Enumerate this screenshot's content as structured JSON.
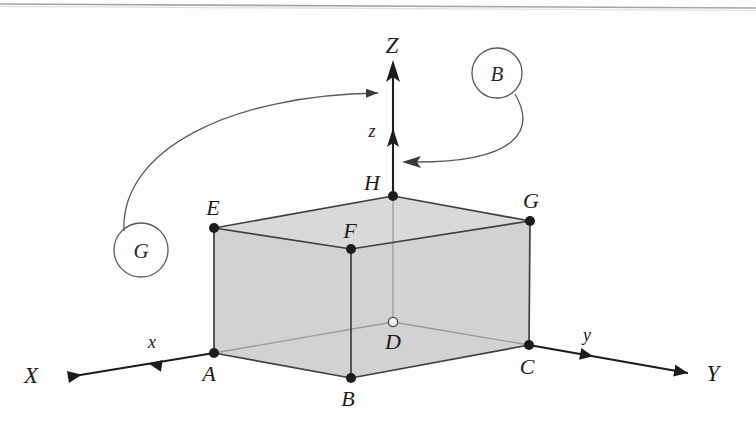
{
  "figure": {
    "background_color": "#fdfdfd",
    "solid_fill_color": "#d4d4d4",
    "edge_color": "#3a3a3a",
    "hidden_edge_color": "#9a9a9a",
    "axis_color": "#1c1c1c",
    "callout_color": "#5a5a5a"
  },
  "vertices": [
    {
      "id": "A",
      "label": "A",
      "x": 214,
      "y": 353,
      "marker": "filled",
      "label_x": 209,
      "label_y": 381
    },
    {
      "id": "B",
      "label": "B",
      "x": 351,
      "y": 378,
      "marker": "filled",
      "label_x": 346,
      "label_y": 406
    },
    {
      "id": "C",
      "label": "C",
      "x": 529,
      "y": 345,
      "marker": "filled",
      "label_x": 524,
      "label_y": 374
    },
    {
      "id": "D",
      "label": "D",
      "x": 393,
      "y": 322,
      "marker": "hollow",
      "label_x": 390,
      "label_y": 349
    },
    {
      "id": "E",
      "label": "E",
      "x": 214,
      "y": 228,
      "marker": "filled",
      "label_x": 210,
      "label_y": 215
    },
    {
      "id": "F",
      "label": "F",
      "x": 351,
      "y": 249,
      "marker": "filled",
      "label_x": 347,
      "label_y": 237
    },
    {
      "id": "G",
      "label": "G",
      "x": 530,
      "y": 221,
      "marker": "filled",
      "label_x": 528,
      "label_y": 208
    },
    {
      "id": "H",
      "label": "H",
      "x": 393,
      "y": 196,
      "marker": "filled",
      "label_x": 368,
      "label_y": 191
    }
  ],
  "axes": [
    {
      "id": "x-axis",
      "major_label": "X",
      "minor_label": "x",
      "major_label_x": 30,
      "major_label_y": 383,
      "minor_label_x": 152,
      "minor_label_y": 348,
      "origin_x": 214,
      "origin_y": 353,
      "tip_x": 62,
      "tip_y": 378,
      "minor_tip_x": 152,
      "minor_tip_y": 367
    },
    {
      "id": "y-axis",
      "major_label": "Y",
      "minor_label": "y",
      "major_label_x": 712,
      "major_label_y": 381,
      "minor_label_x": 586,
      "minor_label_y": 341,
      "origin_x": 529,
      "origin_y": 345,
      "tip_x": 692,
      "tip_y": 374,
      "minor_tip_x": 598,
      "minor_tip_y": 357
    },
    {
      "id": "z-axis",
      "major_label": "Z",
      "minor_label": "z",
      "major_label_x": 385,
      "major_label_y": 52,
      "minor_label_x": 371,
      "minor_label_y": 136,
      "origin_x": 393,
      "origin_y": 196,
      "tip_x": 393,
      "tip_y": 62,
      "minor_tip_x": 393,
      "minor_tip_y": 131
    }
  ],
  "callouts": [
    {
      "id": "callout-g",
      "label": "G",
      "circle_x": 141,
      "circle_y": 250,
      "radius": 27,
      "target_x": 388,
      "target_y": 93,
      "arrow_direction": "right"
    },
    {
      "id": "callout-b",
      "label": "B",
      "circle_x": 497,
      "circle_y": 73,
      "radius": 25,
      "target_x": 400,
      "target_y": 162,
      "arrow_direction": "left"
    }
  ],
  "faces": [
    {
      "id": "left-face",
      "vertices": "A,E,F,B"
    },
    {
      "id": "right-face",
      "vertices": "B,F,G,C"
    },
    {
      "id": "top-face",
      "vertices": "E,H,G,F"
    },
    {
      "id": "bottom-face",
      "vertices": "A,D,C,B"
    }
  ],
  "edges": {
    "visible": [
      "A-B",
      "B-C",
      "A-E",
      "B-F",
      "C-G",
      "E-F",
      "F-G",
      "E-H",
      "H-G"
    ],
    "hidden": [
      "A-D",
      "D-C",
      "D-H"
    ]
  }
}
